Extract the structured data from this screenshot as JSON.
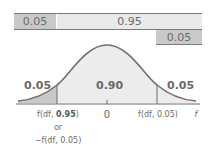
{
  "bars": {
    "top_left": "0.05",
    "top_middle": "0.95",
    "bottom_right": "0.05"
  },
  "curve_labels": {
    "left_tail": "0.05",
    "center": "0.90",
    "right_tail": "0.05"
  },
  "axis": {
    "left_tick_prefix": "f(df, ",
    "left_tick_bold": "0.95",
    "left_tick_suffix": ")",
    "left_tick_or": "or",
    "left_tick_alt": "−f(df, 0.05)",
    "center_tick": "0",
    "right_tick": "f(df, 0.05)",
    "axis_label": "f"
  },
  "colors": {
    "dark_fill": "#c9c9c9",
    "light_fill": "#e9e9e9",
    "curve": "#7a6a6a"
  }
}
